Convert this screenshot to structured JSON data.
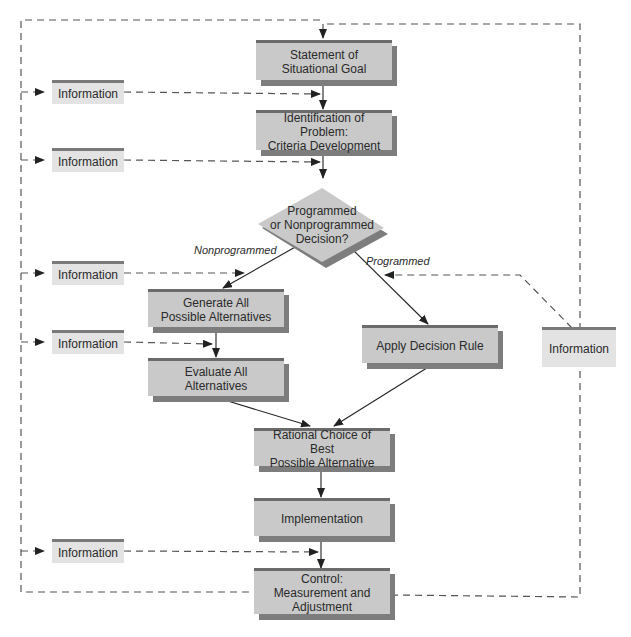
{
  "diagram": {
    "type": "flowchart",
    "nodes": {
      "goal": {
        "line1": "Statement of",
        "line2": "Situational Goal"
      },
      "problem": {
        "line1": "Identification of Problem:",
        "line2": "Criteria Development"
      },
      "decision": {
        "line1": "Programmed",
        "line2": "or Nonprogrammed",
        "line3": "Decision?"
      },
      "generate": {
        "line1": "Generate All",
        "line2": "Possible Alternatives"
      },
      "evaluate": {
        "label": "Evaluate All Alternatives"
      },
      "apply_rule": {
        "label": "Apply Decision Rule"
      },
      "choice": {
        "line1": "Rational Choice of Best",
        "line2": "Possible Alternative"
      },
      "implementation": {
        "label": "Implementation"
      },
      "control": {
        "line1": "Control:",
        "line2": "Measurement and",
        "line3": "Adjustment"
      }
    },
    "info_boxes": [
      {
        "label": "Information"
      },
      {
        "label": "Information"
      },
      {
        "label": "Information"
      },
      {
        "label": "Information"
      },
      {
        "label": "Information"
      },
      {
        "label": "Information"
      }
    ],
    "edge_labels": {
      "nonprogrammed": "Nonprogrammed",
      "programmed": "Programmed"
    },
    "colors": {
      "box_fill": "#c9c9c9",
      "box_top_border": "#6b6b6b",
      "box_shadow": "#7d7d7d",
      "info_fill": "#e3e3e3",
      "line": "#2a2a2a",
      "dashed_line": "#555555"
    }
  }
}
